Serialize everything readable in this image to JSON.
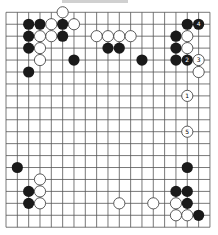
{
  "board": {
    "size": 19,
    "origin_x": 6,
    "origin_y": 12.3,
    "dx": 11.33,
    "dy": 11.94,
    "stone_radius": 5.6,
    "line_color": "#555555",
    "black_color": "#1a1a1a",
    "white_fill": "#ffffff",
    "white_stroke": "#333333"
  },
  "stones": [
    {
      "color": "white",
      "col": 5,
      "row": 0
    },
    {
      "color": "black",
      "col": 2,
      "row": 1
    },
    {
      "color": "black",
      "col": 3,
      "row": 1
    },
    {
      "color": "white",
      "col": 4,
      "row": 1
    },
    {
      "color": "black",
      "col": 5,
      "row": 1
    },
    {
      "color": "white",
      "col": 6,
      "row": 1
    },
    {
      "color": "black",
      "col": 16,
      "row": 1
    },
    {
      "color": "black",
      "col": 17,
      "row": 1,
      "label": "4"
    },
    {
      "color": "black",
      "col": 2,
      "row": 2
    },
    {
      "color": "white",
      "col": 3,
      "row": 2
    },
    {
      "color": "white",
      "col": 4,
      "row": 2
    },
    {
      "color": "black",
      "col": 5,
      "row": 2
    },
    {
      "color": "white",
      "col": 8,
      "row": 2
    },
    {
      "color": "white",
      "col": 9,
      "row": 2
    },
    {
      "color": "white",
      "col": 10,
      "row": 2
    },
    {
      "color": "white",
      "col": 11,
      "row": 2
    },
    {
      "color": "black",
      "col": 15,
      "row": 2
    },
    {
      "color": "white",
      "col": 16,
      "row": 2
    },
    {
      "color": "black",
      "col": 2,
      "row": 3
    },
    {
      "color": "white",
      "col": 3,
      "row": 3
    },
    {
      "color": "black",
      "col": 9,
      "row": 3
    },
    {
      "color": "black",
      "col": 10,
      "row": 3
    },
    {
      "color": "black",
      "col": 15,
      "row": 3
    },
    {
      "color": "white",
      "col": 16,
      "row": 3
    },
    {
      "color": "white",
      "col": 3,
      "row": 4
    },
    {
      "color": "black",
      "col": 6,
      "row": 4
    },
    {
      "color": "black",
      "col": 12,
      "row": 4
    },
    {
      "color": "black",
      "col": 15,
      "row": 4
    },
    {
      "color": "black",
      "col": 16,
      "row": 4,
      "label": "2"
    },
    {
      "color": "white",
      "col": 17,
      "row": 4,
      "label": "3"
    },
    {
      "color": "black",
      "col": 2,
      "row": 5
    },
    {
      "color": "white",
      "col": 17,
      "row": 5
    },
    {
      "color": "white",
      "col": 16,
      "row": 7,
      "label": "1"
    },
    {
      "color": "white",
      "col": 16,
      "row": 10,
      "label": "5"
    },
    {
      "color": "black",
      "col": 1,
      "row": 13
    },
    {
      "color": "black",
      "col": 16,
      "row": 13
    },
    {
      "color": "white",
      "col": 3,
      "row": 14
    },
    {
      "color": "black",
      "col": 2,
      "row": 15
    },
    {
      "color": "white",
      "col": 3,
      "row": 15
    },
    {
      "color": "black",
      "col": 15,
      "row": 15
    },
    {
      "color": "black",
      "col": 16,
      "row": 15
    },
    {
      "color": "black",
      "col": 2,
      "row": 16
    },
    {
      "color": "white",
      "col": 3,
      "row": 16
    },
    {
      "color": "white",
      "col": 10,
      "row": 16
    },
    {
      "color": "white",
      "col": 13,
      "row": 16
    },
    {
      "color": "white",
      "col": 15,
      "row": 16
    },
    {
      "color": "black",
      "col": 16,
      "row": 16
    },
    {
      "color": "white",
      "col": 15,
      "row": 17
    },
    {
      "color": "white",
      "col": 16,
      "row": 17
    },
    {
      "color": "black",
      "col": 17,
      "row": 17
    }
  ]
}
